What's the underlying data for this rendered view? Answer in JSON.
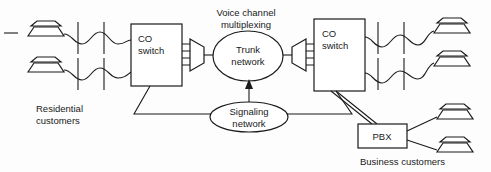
{
  "diagram": {
    "background_color": "#fdfdfd",
    "line_color": "#1a1a1a",
    "nodes": {
      "co_switch_left": {
        "label_line1": "CO",
        "label_line2": "switch"
      },
      "co_switch_right": {
        "label_line1": "CO",
        "label_line2": "switch"
      },
      "trunk_network": {
        "label_line1": "Trunk",
        "label_line2": "network"
      },
      "signaling_network": {
        "label_line1": "Signaling",
        "label_line2": "network"
      },
      "pbx": {
        "label": "PBX"
      }
    },
    "labels": {
      "voice_channel_multiplexing_line1": "Voice channel",
      "voice_channel_multiplexing_line2": "multiplexing",
      "residential_customers_line1": "Residential",
      "residential_customers_line2": "customers",
      "business_customers": "Business customers"
    },
    "icons": {
      "telephone": "telephone-icon",
      "multiplexer": "multiplexer-icon",
      "cross_connect": "cross-connect-icon",
      "arrow_up": "arrow-up-icon"
    },
    "counts": {
      "residential_phones_left": 2,
      "residential_phones_right": 2,
      "business_phones": 2,
      "multiplexer_ports": 4
    }
  }
}
